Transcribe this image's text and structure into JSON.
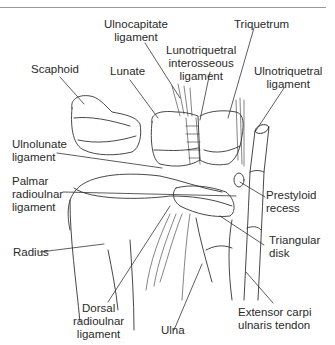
{
  "diagram": {
    "labels": [
      {
        "id": "ulnocapitate",
        "lines": [
          "Ulnocapitate",
          "ligament"
        ]
      },
      {
        "id": "triquetrum",
        "lines": [
          "Triquetrum"
        ]
      },
      {
        "id": "lunotriquetral",
        "lines": [
          "Lunotriquetral",
          "interosseous",
          "ligament"
        ]
      },
      {
        "id": "scaphoid",
        "lines": [
          "Scaphoid"
        ]
      },
      {
        "id": "lunate",
        "lines": [
          "Lunate"
        ]
      },
      {
        "id": "ulnotriquetral",
        "lines": [
          "Ulnotriquetral",
          "ligament"
        ]
      },
      {
        "id": "ulnolunate",
        "lines": [
          "Ulnolunate",
          "ligament"
        ]
      },
      {
        "id": "palmar_radioulnar",
        "lines": [
          "Palmar",
          "radioulnar",
          "ligament"
        ]
      },
      {
        "id": "prestyloid",
        "lines": [
          "Prestyloid",
          "recess"
        ]
      },
      {
        "id": "radius",
        "lines": [
          "Radius"
        ]
      },
      {
        "id": "triangular_disk",
        "lines": [
          "Triangular",
          "disk"
        ]
      },
      {
        "id": "dorsal_radioulnar",
        "lines": [
          "Dorsal",
          "radioulnar",
          "ligament"
        ]
      },
      {
        "id": "ulna",
        "lines": [
          "Ulna"
        ]
      },
      {
        "id": "ecu_tendon",
        "lines": [
          "Extensor carpi",
          "ulnaris tendon"
        ]
      }
    ]
  },
  "colors": {
    "line": "#333333",
    "rule": "#9a9a9a",
    "text": "#2a2a2a"
  }
}
